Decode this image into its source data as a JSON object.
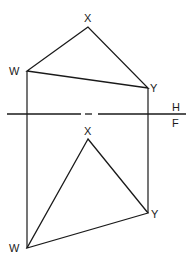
{
  "diagram": {
    "type": "orthographic-projection",
    "fold_line": {
      "upper_label": "H",
      "lower_label": "F"
    },
    "top_view": {
      "vertices": [
        {
          "name": "X",
          "label": "X"
        },
        {
          "name": "W",
          "label": "W"
        },
        {
          "name": "Y",
          "label": "Y"
        }
      ]
    },
    "front_view": {
      "vertices": [
        {
          "name": "X",
          "label": "X"
        },
        {
          "name": "W",
          "label": "W"
        },
        {
          "name": "Y",
          "label": "Y"
        }
      ]
    },
    "colors": {
      "line": "#1a1a1a",
      "background": "#ffffff"
    }
  }
}
